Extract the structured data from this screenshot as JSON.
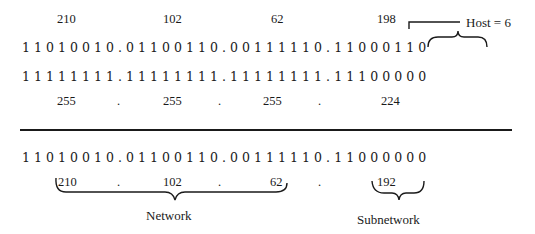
{
  "top": {
    "ip_decimal": [
      "210",
      "102",
      "62",
      "198"
    ],
    "ip_binary": "11010010.01100110.00111110.11000110",
    "host_annotation": "Host = 6",
    "mask_binary": "11111111.11111111.11111111.11100000",
    "mask_decimal": [
      "255",
      "255",
      "255",
      "224"
    ],
    "separator": "."
  },
  "bottom": {
    "result_binary": "11010010.01100110.00111110.11000000",
    "result_decimal": [
      "210",
      "102",
      "62",
      "192"
    ],
    "separator": ".",
    "network_label": "Network",
    "subnetwork_label": "Subnetwork"
  },
  "colors": {
    "ink": "#1a1a1a",
    "background": "#ffffff"
  }
}
